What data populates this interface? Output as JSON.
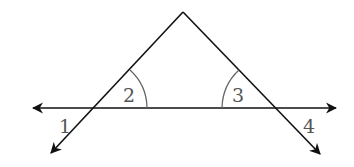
{
  "diagram": {
    "type": "geometry",
    "colors": {
      "line": "#111111",
      "arc": "#666666",
      "label": "#555555",
      "background": "#ffffff"
    },
    "points": {
      "apex": [
        183,
        12
      ],
      "left_intersection": [
        95,
        108
      ],
      "right_intersection": [
        275,
        108
      ]
    },
    "angles": [
      {
        "id": "1",
        "label": "1",
        "position": "exterior-left-below"
      },
      {
        "id": "2",
        "label": "2",
        "position": "interior-left-base"
      },
      {
        "id": "3",
        "label": "3",
        "position": "interior-right-base"
      },
      {
        "id": "4",
        "label": "4",
        "position": "exterior-right-below"
      }
    ]
  }
}
